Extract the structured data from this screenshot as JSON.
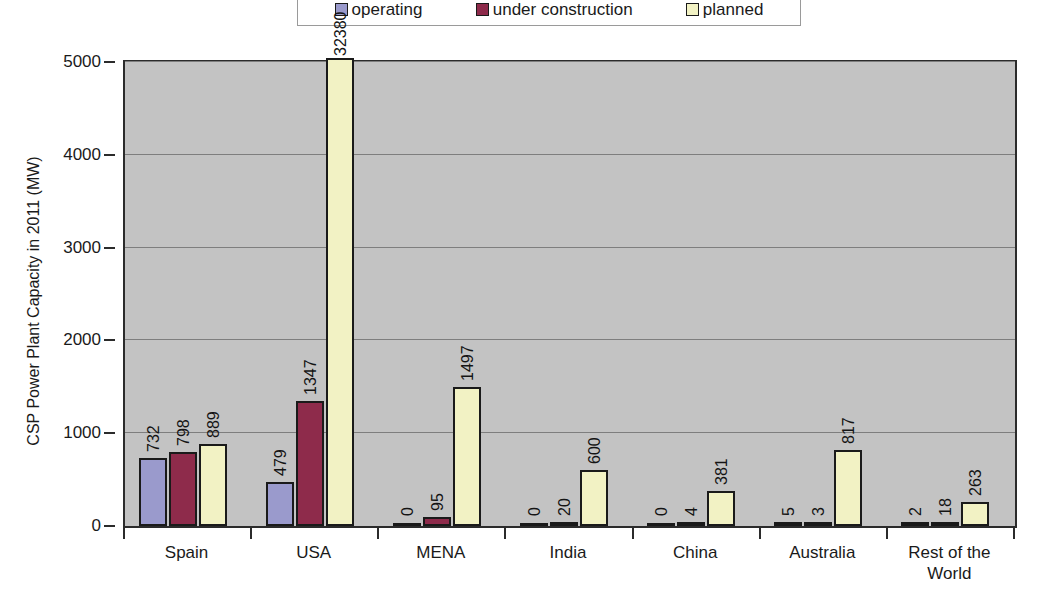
{
  "chart_data": {
    "type": "bar",
    "title": "",
    "xlabel": "",
    "ylabel": "CSP Power Plant Capacity in 2011 (MW)",
    "ylim": [
      0,
      5000
    ],
    "ytick_labels": [
      "0",
      "1000",
      "2000",
      "3000",
      "4000",
      "5000"
    ],
    "grid": true,
    "legend_position": "top",
    "categories": [
      "Spain",
      "USA",
      "MENA",
      "India",
      "China",
      "Australia",
      "Rest of the\nWorld"
    ],
    "series": [
      {
        "name": "operating",
        "color": "#9a9acc",
        "values": [
          732,
          479,
          0,
          0,
          0,
          5,
          2
        ]
      },
      {
        "name": "under construction",
        "color": "#8e2b4b",
        "values": [
          798,
          1347,
          95,
          20,
          4,
          3,
          18
        ]
      },
      {
        "name": "planned",
        "color": "#f2f2c4",
        "values": [
          889,
          32380,
          1497,
          600,
          381,
          817,
          263
        ]
      }
    ],
    "value_labels": [
      [
        "732",
        "798",
        "889"
      ],
      [
        "479",
        "1347",
        "32380"
      ],
      [
        "0",
        "95",
        "1497"
      ],
      [
        "0",
        "20",
        "600"
      ],
      [
        "0",
        "4",
        "381"
      ],
      [
        "5",
        "3",
        "817"
      ],
      [
        "2",
        "18",
        "263"
      ]
    ]
  },
  "legend": {
    "items": [
      {
        "label": "operating",
        "color": "#9a9acc"
      },
      {
        "label": "under construction",
        "color": "#8e2b4b"
      },
      {
        "label": "planned",
        "color": "#f2f2c4"
      }
    ]
  },
  "colors": {
    "plot_background": "#c3c3c3",
    "axis": "#2b2b2b",
    "gridline": "#7e7e7e",
    "page_background": "#ffffff"
  }
}
